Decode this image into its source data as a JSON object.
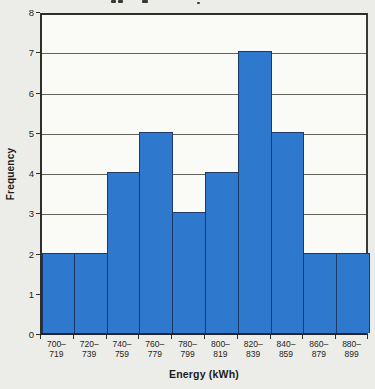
{
  "page": {
    "background_color": "#ecede8",
    "title_visible": "",
    "title_note": "title cropped off at top edge; only letter descender marks visible"
  },
  "chart_data": {
    "type": "bar",
    "subtype": "histogram",
    "title": "",
    "xlabel": "Energy (kWh)",
    "ylabel": "Frequency",
    "categories": [
      "700–719",
      "720–739",
      "740–759",
      "760–779",
      "780–799",
      "800–819",
      "820–839",
      "840–859",
      "860–879",
      "880–899"
    ],
    "category_lines": [
      {
        "line1": "700–",
        "line2": "719"
      },
      {
        "line1": "720–",
        "line2": "739"
      },
      {
        "line1": "740–",
        "line2": "759"
      },
      {
        "line1": "760–",
        "line2": "779"
      },
      {
        "line1": "780–",
        "line2": "799"
      },
      {
        "line1": "800–",
        "line2": "819"
      },
      {
        "line1": "820–",
        "line2": "839"
      },
      {
        "line1": "840–",
        "line2": "859"
      },
      {
        "line1": "860–",
        "line2": "879"
      },
      {
        "line1": "880–",
        "line2": "899"
      }
    ],
    "values": [
      2,
      2,
      4,
      5,
      3,
      4,
      7,
      5,
      2,
      2
    ],
    "ylim": [
      0,
      8
    ],
    "yticks": [
      0,
      1,
      2,
      3,
      4,
      5,
      6,
      7,
      8
    ],
    "grid": true,
    "legend": false,
    "bar_fill_color": "#2e79cd",
    "bar_border_color": "#1d3a66",
    "gridline_color": "#63635c",
    "plot_background": "#fafbf7",
    "axis_color": "#2e2e29"
  }
}
